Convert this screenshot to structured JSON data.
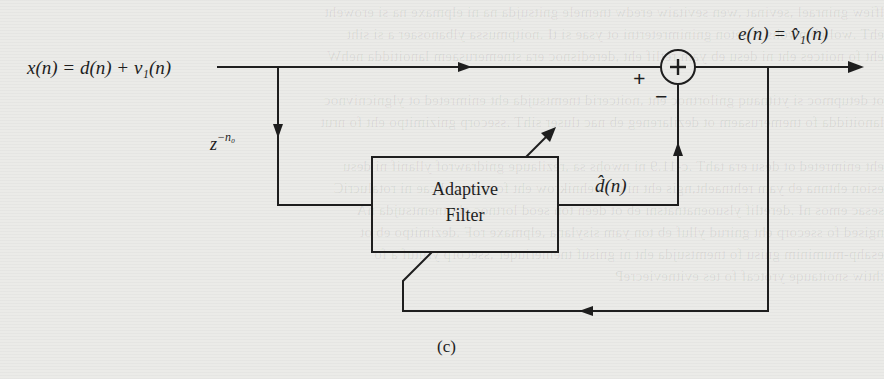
{
  "diagram": {
    "caption": "(c)",
    "input_label": "x(n) = d(n) + v₁(n)",
    "output_label": "e(n) = v̂₁(n)",
    "delay_label_base": "z",
    "delay_label_exp": "−n₀",
    "filter_block": {
      "line1": "Adaptive",
      "line2": "Filter"
    },
    "filter_output_label": "d̂(n)",
    "summer": {
      "symbol": "+",
      "plus_input_sign": "+",
      "minus_input_sign": "−"
    },
    "nodes": [
      "input x(n)",
      "delay z^-n0",
      "Adaptive Filter",
      "summing junction",
      "output e(n)"
    ],
    "edges": [
      {
        "from": "input x(n)",
        "to": "summing junction",
        "sign": "+"
      },
      {
        "from": "input x(n)",
        "to": "delay z^-n0"
      },
      {
        "from": "delay z^-n0",
        "to": "Adaptive Filter"
      },
      {
        "from": "Adaptive Filter",
        "to": "summing junction",
        "sign": "−",
        "label": "d̂(n)"
      },
      {
        "from": "summing junction",
        "to": "output e(n)"
      },
      {
        "from": "output e(n)",
        "to": "Adaptive Filter",
        "type": "adaptation feedback"
      }
    ],
    "line_color": "#1e1e1e",
    "background_color": "#ebebe8"
  }
}
